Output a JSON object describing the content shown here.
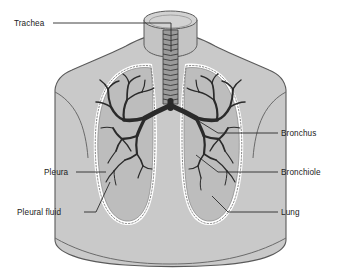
{
  "figure": {
    "background_color": "#ffffff",
    "width": 340,
    "height": 278
  },
  "palette": {
    "body_fill": "#c9c9c9",
    "body_stroke": "#5a5a5a",
    "neck_fill": "#c4c4c4",
    "lung_fill": "#bdbdbd",
    "pleural_fluid": "#ffffff",
    "pleura_line": "#6e6e6e",
    "bronchi": "#2a2a2a",
    "trachea_fill": "#9a9a9a",
    "leader_line": "#2b2b2b",
    "label_text": "#222222"
  },
  "labels": [
    {
      "id": "trachea",
      "text": "Trachea",
      "side": "left",
      "text_x": 14,
      "text_y": 26,
      "anchor_x": 171,
      "anchor_y": 52
    },
    {
      "id": "bronchus",
      "text": "Bronchus",
      "side": "right",
      "text_x": 281,
      "text_y": 136,
      "anchor_x": 197,
      "anchor_y": 120
    },
    {
      "id": "bronchiole",
      "text": "Bronchiole",
      "side": "right",
      "text_x": 281,
      "text_y": 175,
      "anchor_x": 196,
      "anchor_y": 155
    },
    {
      "id": "lung",
      "text": "Lung",
      "side": "right",
      "text_x": 281,
      "text_y": 215,
      "anchor_x": 212,
      "anchor_y": 188
    },
    {
      "id": "pleura",
      "text": "Pleura",
      "side": "left",
      "text_x": 44,
      "text_y": 175,
      "anchor_x": 106,
      "anchor_y": 173
    },
    {
      "id": "pleural-fluid",
      "text": "Pleural fluid",
      "side": "left",
      "text_x": 17,
      "text_y": 215,
      "anchor_x": 110,
      "anchor_y": 182
    }
  ],
  "anatomy": {
    "trachea_rings": 14,
    "lung_count": 2,
    "structures": [
      "neck",
      "torso",
      "shoulders",
      "left-lung",
      "right-lung",
      "trachea",
      "bronchial-tree",
      "pleura-membrane",
      "pleural-fluid-layer"
    ]
  }
}
